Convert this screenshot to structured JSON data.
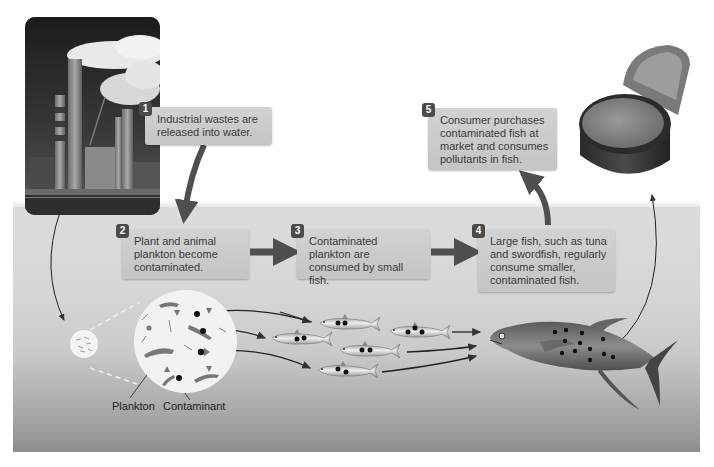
{
  "diagram": {
    "steps": [
      {
        "number": "1",
        "text": "Industrial wastes are released into water."
      },
      {
        "number": "2",
        "text": "Plant and animal plankton become contaminated."
      },
      {
        "number": "3",
        "text": "Contaminated plankton are consumed by small fish."
      },
      {
        "number": "4",
        "text": "Large fish, such as tuna and swordfish, regularly consume smaller, contaminated fish."
      },
      {
        "number": "5",
        "text": "Consumer purchases contaminated fish at market and consumes pollutants in fish."
      }
    ],
    "labels": {
      "plankton": "Plankton",
      "contaminant": "Contaminant"
    },
    "images": {
      "factory": "industrial-smokestacks-photo",
      "can": "open-tuna-can-photo",
      "plankton_magnified": "magnified-plankton-circle",
      "small_fish_count": 5,
      "large_fish": "tuna"
    },
    "colors": {
      "box_fill": "#c9c9c9",
      "badge_fill": "#4a4a4a",
      "arrow": "#4f4f4f",
      "text": "#3a3a3a",
      "water_top": "#dcdcdc",
      "water_bottom": "#8e8e8e"
    }
  }
}
